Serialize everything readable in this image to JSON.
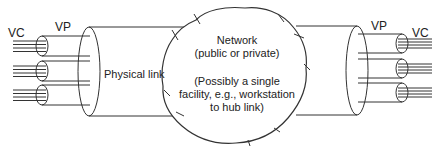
{
  "diagram": {
    "left": {
      "vc_label": "VC",
      "vp_label": "VP",
      "link_label": "Physical link"
    },
    "right": {
      "vc_label": "VC",
      "vp_label": "VP"
    },
    "network": {
      "title_line1": "Network",
      "title_line2": "(public or private)",
      "note_line1": "(Possibly a single",
      "note_line2": "facility, e.g., workstation",
      "note_line3": "to hub link)"
    },
    "colors": {
      "stroke": "#333333",
      "text": "#222222",
      "background": "#ffffff"
    }
  }
}
